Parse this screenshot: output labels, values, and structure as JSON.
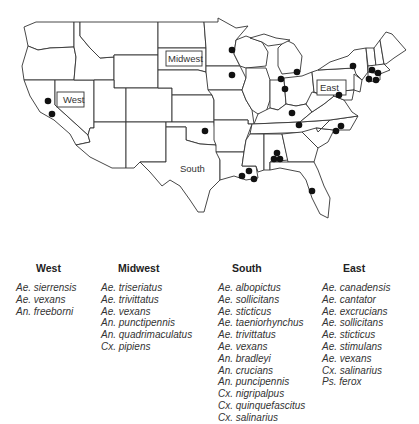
{
  "map": {
    "title": "US sampling sites by region",
    "region_labels": {
      "west": "West",
      "midwest": "Midwest",
      "south": "South",
      "east": "East"
    },
    "site_markers": [
      {
        "region": "West",
        "location": "Northern California"
      },
      {
        "region": "West",
        "location": "Central California"
      },
      {
        "region": "Midwest",
        "location": "Minnesota"
      },
      {
        "region": "Midwest",
        "location": "Iowa"
      },
      {
        "region": "Midwest",
        "location": "Michigan (west)"
      },
      {
        "region": "Midwest",
        "location": "Michigan (east)"
      },
      {
        "region": "Midwest",
        "location": "Indiana"
      },
      {
        "region": "South",
        "location": "Oklahoma"
      },
      {
        "region": "South",
        "location": "Kentucky"
      },
      {
        "region": "South",
        "location": "Tennessee"
      },
      {
        "region": "South",
        "location": "Alabama (1)"
      },
      {
        "region": "South",
        "location": "Alabama (2)"
      },
      {
        "region": "South",
        "location": "Alabama (3)"
      },
      {
        "region": "South",
        "location": "Louisiana (1)"
      },
      {
        "region": "South",
        "location": "Louisiana (2)"
      },
      {
        "region": "South",
        "location": "Louisiana (3)"
      },
      {
        "region": "South",
        "location": "Florida"
      },
      {
        "region": "South",
        "location": "North Carolina (1)"
      },
      {
        "region": "South",
        "location": "North Carolina (2)"
      },
      {
        "region": "East",
        "location": "New York"
      },
      {
        "region": "East",
        "location": "Pennsylvania"
      },
      {
        "region": "East",
        "location": "New England (1)"
      },
      {
        "region": "East",
        "location": "New England (2)"
      },
      {
        "region": "East",
        "location": "New England (3)"
      },
      {
        "region": "East",
        "location": "New England (4)"
      }
    ]
  },
  "species_lists": [
    {
      "region": "West",
      "species": [
        "Ae. sierrensis",
        "Ae. vexans",
        "An. freeborni"
      ]
    },
    {
      "region": "Midwest",
      "species": [
        "Ae. triseriatus",
        "Ae. trivittatus",
        "Ae. vexans",
        "An. punctipennis",
        "An. quadrimaculatus",
        "Cx. pipiens"
      ]
    },
    {
      "region": "South",
      "species": [
        "Ae. albopictus",
        "Ae. sollicitans",
        "Ae. sticticus",
        "Ae. taeniorhynchus",
        "Ae. trivittatus",
        "Ae. vexans",
        "An. bradleyi",
        "An. crucians",
        "An. puncipennis",
        "Cx. nigripalpus",
        "Cx. quinquefascitus",
        "Cx. salinarius"
      ]
    },
    {
      "region": "East",
      "species": [
        "Ae. canadensis",
        "Ae. cantator",
        "Ae. excrucians",
        "Ae. sollicitans",
        "Ae. sticticus",
        "Ae. stimulans",
        "Ae. vexans",
        "Cx. salinarius",
        "Ps. ferox"
      ]
    }
  ]
}
